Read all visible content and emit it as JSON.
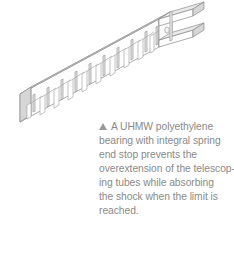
{
  "figure": {
    "background_color": "#ffffff",
    "illustration": {
      "name": "uhmw-polyethylene-bearing-isometric-drawing",
      "subject": "UHMW polyethylene bearing with integral spring end stop",
      "view": "isometric line drawing",
      "line_color": "#8b8b8b",
      "face_light_color": "#fdfdfd",
      "face_mid_color": "#ededed",
      "face_dark_color": "#d8d8d8",
      "slot_count": 10,
      "has_end_channel_block": true,
      "end_block_hole": true
    }
  },
  "caption": {
    "marker": "triangle-up-marker",
    "marker_color": "#9a9a9a",
    "text_color": "#8a8a8a",
    "full_text": "A UHMW polyethylene bearing with integral spring end stop prevents the overextension of the telescoping tubes while absorbing the shock when the limit is reached.",
    "lines": [
      "A UHMW polyethylene",
      "bearing with integral spring",
      "end stop prevents the",
      "overextension of the telescop-",
      "ing tubes while absorbing",
      "the shock when the limit is",
      "reached."
    ]
  }
}
